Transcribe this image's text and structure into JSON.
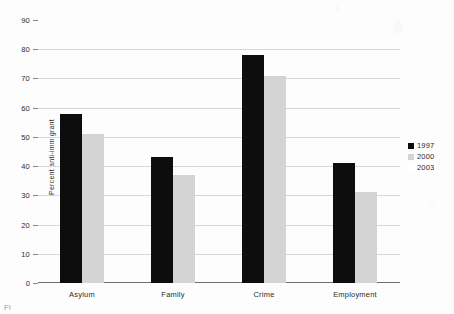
{
  "chart_data": {
    "type": "bar",
    "title": "",
    "subtitle": "",
    "xlabel": "",
    "ylabel": "Percent anti-immigrant",
    "categories": [
      "Asylum",
      "Family",
      "Crime",
      "Employment"
    ],
    "series": [
      {
        "name": "1997",
        "color": "#0d0d0d",
        "values": [
          58,
          43,
          78,
          41
        ]
      },
      {
        "name": "2000",
        "color": "#d4d4d4",
        "values": [
          51,
          37,
          71,
          31
        ]
      },
      {
        "name": "2003",
        "color": "#ffffff",
        "values": [
          0,
          0,
          0,
          0
        ]
      }
    ],
    "ylim": [
      0,
      90
    ],
    "ytick_values": [
      0,
      10,
      20,
      30,
      40,
      50,
      60,
      70,
      80,
      90
    ],
    "ytick_labels": [
      "0",
      "10",
      "20",
      "30",
      "40",
      "50",
      "60",
      "70",
      "80",
      "90"
    ],
    "grid": true,
    "legend_position": "right"
  },
  "legend": {
    "entries": [
      {
        "label": "1997",
        "swatch": "black-swatch"
      },
      {
        "label": "2000",
        "swatch": "gray-swatch"
      },
      {
        "label": "2003",
        "swatch": "white-swatch"
      }
    ]
  },
  "caption": {
    "text": "Fi"
  }
}
